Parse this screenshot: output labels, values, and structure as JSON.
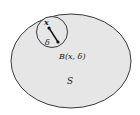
{
  "diagram": {
    "set_label": "S",
    "ball_label": "B(x, δ)",
    "center_label": "x",
    "radius_label": "δ",
    "colors": {
      "set_fill": "#e6e6e6",
      "stroke": "#3a3a3a",
      "ball_fill": "#e6e6e6",
      "background": "#ffffff"
    }
  }
}
